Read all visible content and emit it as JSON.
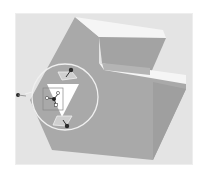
{
  "viewport": {
    "background": "#e4e4e4",
    "model": {
      "name": "E-shaped block",
      "front_face_color": "#a9a9a9",
      "top_face_color": "#f4f4f4",
      "side_face_color": "#8f8f8f"
    },
    "manipulator": {
      "ring_color": "#f0f0f0",
      "handle_color": "#2a2a2a",
      "handles": [
        "top-handle",
        "bottom-handle",
        "left-handle"
      ],
      "triad_labels": [
        "x",
        "y",
        "z"
      ]
    }
  }
}
